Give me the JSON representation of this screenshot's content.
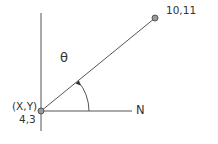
{
  "diagram": {
    "type": "bearing-angle-diagram",
    "start_point": {
      "label": "(X,Y)",
      "value": "4,3"
    },
    "end_point": {
      "label": "10,11"
    },
    "reference_axis_label": "N",
    "angle_symbol": "θ",
    "colors": {
      "line": "#555555",
      "point_fill": "#9a9a9a",
      "point_stroke": "#555555",
      "text": "#333333"
    }
  }
}
